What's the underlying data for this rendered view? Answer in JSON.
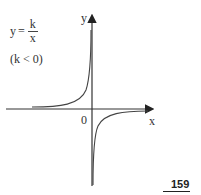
{
  "formula": {
    "lhs": "y",
    "equals": "=",
    "numerator": "k",
    "denominator": "x",
    "condition": "(k < 0)"
  },
  "axes": {
    "x_label": "x",
    "y_label": "y",
    "origin_label": "0"
  },
  "page_number": "159",
  "colors": {
    "stroke": "#333333",
    "background": "#ffffff"
  }
}
